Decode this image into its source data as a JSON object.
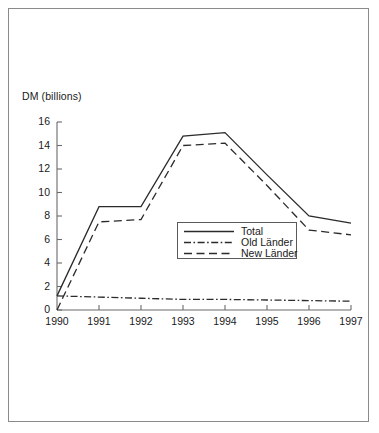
{
  "chart_data": {
    "type": "line",
    "title": "",
    "subtitle": "",
    "xlabel": "",
    "ylabel": "DM (billions)",
    "categories": [
      "1990",
      "1991",
      "1992",
      "1993",
      "1994",
      "1995",
      "1996",
      "1997"
    ],
    "x": [
      1990,
      1991,
      1992,
      1993,
      1994,
      1995,
      1996,
      1997
    ],
    "xlim": [
      1990,
      1997
    ],
    "ylim": [
      0,
      16
    ],
    "ytick_labels": [
      "0",
      "2",
      "4",
      "6",
      "8",
      "10",
      "12",
      "14",
      "16"
    ],
    "yticks": [
      0,
      2,
      4,
      6,
      8,
      10,
      12,
      14,
      16
    ],
    "xtick_labels": [
      "1990",
      "1991",
      "1992",
      "1993",
      "1994",
      "1995",
      "1996",
      "1997"
    ],
    "grid": false,
    "legend_position": "center-right-inside",
    "series": [
      {
        "name": "Total",
        "style": "solid",
        "color": "#2b2b2b",
        "values": [
          1.2,
          8.8,
          8.8,
          14.8,
          15.1,
          11.5,
          8.0,
          7.4
        ]
      },
      {
        "name": "Old Länder",
        "style": "dash-dot",
        "color": "#2b2b2b",
        "values": [
          1.2,
          1.1,
          1.0,
          0.9,
          0.9,
          0.85,
          0.8,
          0.75
        ]
      },
      {
        "name": "New Länder",
        "style": "dashed",
        "color": "#2b2b2b",
        "values": [
          0.0,
          7.5,
          7.7,
          14.0,
          14.2,
          10.6,
          6.8,
          6.4
        ]
      }
    ],
    "annotations": []
  },
  "legend": {
    "items": [
      {
        "label": "Total"
      },
      {
        "label": "Old Länder"
      },
      {
        "label": "New Länder"
      }
    ]
  },
  "colors": {
    "line": "#2b2b2b",
    "axis": "#6b6b6b",
    "border": "#8a8a8a",
    "background": "#ffffff",
    "text": "#1a1a1a"
  }
}
